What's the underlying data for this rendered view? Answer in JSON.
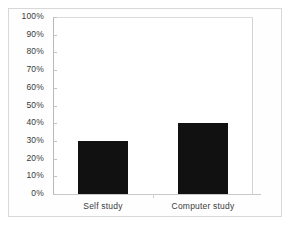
{
  "chart_data": {
    "type": "bar",
    "title": "",
    "subtitle": "",
    "xlabel": "",
    "ylabel": "",
    "categories": [
      "Self study",
      "Computer study"
    ],
    "values": [
      30,
      40
    ],
    "value_labels": [
      "30%",
      "40%"
    ],
    "ylim": [
      0,
      100
    ],
    "ytick_values": [
      0,
      10,
      20,
      30,
      40,
      50,
      60,
      70,
      80,
      90,
      100
    ],
    "ytick_labels": [
      "0%",
      "10%",
      "20%",
      "30%",
      "40%",
      "50%",
      "60%",
      "70%",
      "80%",
      "90%",
      "100%"
    ],
    "grid": false,
    "legend": false,
    "legend_position": "none",
    "series": [
      {
        "name": "",
        "values": [
          30,
          40
        ],
        "color": "#111111"
      }
    ],
    "annotations": []
  },
  "style": {
    "bar_color": "#111111",
    "axis_color": "#b9b9b9",
    "tick_color": "#c2c2c2",
    "tick_label_color": "#3a3a3a",
    "frame_color": "#d8d8d8",
    "plot_background": "#ffffff",
    "figure_background": "#ffffff"
  }
}
